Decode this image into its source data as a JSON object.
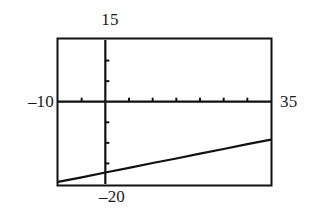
{
  "figure": {
    "kind": "line-plot",
    "background_color": "#ffffff",
    "frame_color": "#000000",
    "curve_color": "#000000"
  },
  "labels": {
    "top": "15",
    "bottom": "–20",
    "left": "–10",
    "right": "35"
  },
  "chart_data": {
    "type": "line",
    "title": "",
    "xlabel": "",
    "ylabel": "",
    "xlim": [
      -10,
      35
    ],
    "ylim": [
      -20,
      15
    ],
    "grid": false,
    "legend": null,
    "frame": true,
    "axes_cross_at": [
      0,
      0
    ],
    "x_tick_values": [
      -5,
      0,
      5,
      10,
      15,
      20,
      25,
      30
    ],
    "y_tick_values": [
      -15,
      -10,
      -5,
      0,
      5,
      10
    ],
    "series": [
      {
        "name": "line",
        "x": [
          -10,
          -5,
          0,
          5,
          10,
          15,
          20,
          25,
          30,
          35
        ],
        "y": [
          -19.5,
          -18.4,
          -17.2,
          -16.1,
          -14.9,
          -13.8,
          -12.6,
          -11.5,
          -10.3,
          -9.2
        ],
        "slope": 0.233,
        "intercept": -17.2,
        "x_intercept": 31.0,
        "y_intercept": -17.2
      }
    ]
  }
}
